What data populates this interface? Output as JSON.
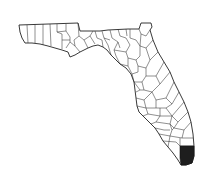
{
  "map": {
    "title": "Florida counties",
    "region": "Florida",
    "highlighted_county": "Miami-Dade",
    "colors": {
      "background": "#ffffff",
      "outline": "#222222",
      "county_fill": "#ffffff",
      "highlight_fill": "#1e1e1e"
    }
  }
}
